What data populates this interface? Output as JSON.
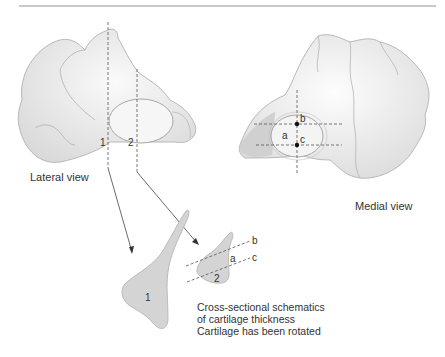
{
  "figure": {
    "lateral_view": {
      "label": "Lateral view",
      "section_lines": [
        "1",
        "2"
      ]
    },
    "medial_view": {
      "label": "Medial view",
      "points": [
        "a",
        "b",
        "c"
      ]
    },
    "cross_sections": {
      "section_1_label": "1",
      "section_2_label": "2",
      "section_2_markers": [
        "a",
        "b",
        "c"
      ],
      "caption_lines": [
        "Cross-sectional schematics",
        "of cartilage thickness",
        "Cartilage has been rotated"
      ]
    },
    "colors": {
      "bone_fill": "#e8e8e8",
      "bone_outline": "#b8b8b8",
      "cartilage_fill": "#f4f4f4",
      "section_fill": "#d4d4d4",
      "line": "#555555",
      "rule": "#c8c8c8"
    }
  }
}
